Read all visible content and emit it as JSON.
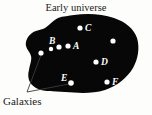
{
  "figure": {
    "title": "Early universe",
    "callout_label": "Galaxies",
    "colors": {
      "background": "#fdfdfb",
      "universe_fill": "#070707",
      "galaxy_dot": "#ffffff",
      "text": "#1a1a1a",
      "label_text": "#ffffff",
      "leader_line": "#3c3c3c"
    },
    "universe_blob": {
      "path": "M 74 15 C 88 13 102 14 114 18 C 126 22 134 29 137 38 C 140 48 138 59 133 68 C 127 78 117 86 105 90 C 92 94 78 93 65 92 C 53 91 43 92 36 88 C 29 84 27 77 29 70 C 30 64 32 60 31 56 C 30 52 27 50 26 46 C 25 41 28 36 32 33 C 36 30 41 30 45 28 C 50 25 52 21 58 18 C 63 16 69 16 74 15 Z"
    },
    "galaxies": [
      {
        "id": "C",
        "label": "C",
        "cx": 80,
        "cy": 28,
        "r": 2.6,
        "label_x": 85,
        "label_y": 31
      },
      {
        "id": "A",
        "label": "A",
        "cx": 68,
        "cy": 46,
        "r": 2.6,
        "label_x": 73,
        "label_y": 49
      },
      {
        "id": "B",
        "label": "B",
        "cx": 59,
        "cy": 47,
        "r": 2.6,
        "label_x": 49,
        "label_y": 44
      },
      {
        "id": "D",
        "label": "D",
        "cx": 96,
        "cy": 62,
        "r": 2.6,
        "label_x": 101,
        "label_y": 65
      },
      {
        "id": "E",
        "label": "E",
        "cx": 71,
        "cy": 83,
        "r": 2.8,
        "label_x": 61,
        "label_y": 81
      },
      {
        "id": "F",
        "label": "F",
        "cx": 107,
        "cy": 82,
        "r": 2.6,
        "label_x": 112,
        "label_y": 85
      },
      {
        "id": "unlabeled-left",
        "label": "",
        "cx": 41,
        "cy": 53,
        "r": 2.6,
        "label_x": 0,
        "label_y": 0
      },
      {
        "id": "unlabeled-upper-right",
        "label": "",
        "cx": 113,
        "cy": 41,
        "r": 2.6,
        "label_x": 0,
        "label_y": 0
      },
      {
        "id": "unlabeled-mid-left",
        "label": "",
        "cx": 51,
        "cy": 49,
        "r": 2.2,
        "label_x": 0,
        "label_y": 0
      }
    ],
    "leader_lines": [
      {
        "id": "leader-to-left-dot",
        "x1": 27,
        "y1": 92,
        "x2": 41,
        "y2": 55
      },
      {
        "id": "leader-to-galaxy-e",
        "x1": 27,
        "y1": 92,
        "x2": 69,
        "y2": 84
      }
    ],
    "title_pos": {
      "x": 76,
      "y": 11
    },
    "callout_pos": {
      "x": 3,
      "y": 105
    }
  }
}
